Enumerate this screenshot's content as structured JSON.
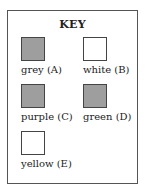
{
  "key": {
    "title": "KEY",
    "items": [
      {
        "label": "grey (A)",
        "color": "#9e9e9e"
      },
      {
        "label": "white (B)",
        "color": "#ffffff"
      },
      {
        "label": "purple (C)",
        "color": "#9e9e9e"
      },
      {
        "label": "green (D)",
        "color": "#9e9e9e"
      },
      {
        "label": "yellow (E)",
        "color": "#ffffff"
      }
    ]
  }
}
